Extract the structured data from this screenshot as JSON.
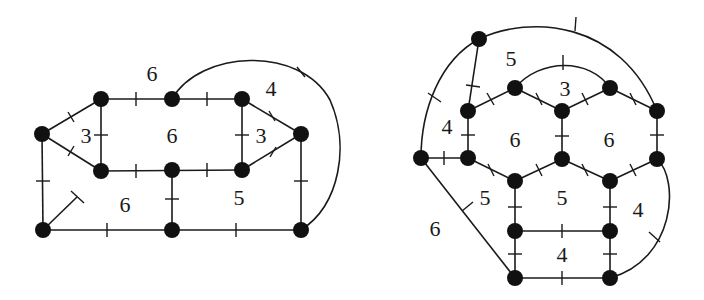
{
  "diagrams": [
    {
      "name": "left-graph",
      "nodes": [
        {
          "id": "a",
          "x": 42,
          "y": 134
        },
        {
          "id": "b",
          "x": 101,
          "y": 99
        },
        {
          "id": "c",
          "x": 101,
          "y": 171
        },
        {
          "id": "d",
          "x": 172,
          "y": 99
        },
        {
          "id": "e",
          "x": 172,
          "y": 170
        },
        {
          "id": "f",
          "x": 242,
          "y": 99
        },
        {
          "id": "g",
          "x": 242,
          "y": 170
        },
        {
          "id": "h",
          "x": 301,
          "y": 134
        },
        {
          "id": "i",
          "x": 43,
          "y": 230
        },
        {
          "id": "j",
          "x": 172,
          "y": 230
        },
        {
          "id": "k",
          "x": 301,
          "y": 230
        }
      ],
      "face_labels": [
        {
          "text": "6",
          "x": 152,
          "y": 74
        },
        {
          "text": "4",
          "x": 271,
          "y": 90
        },
        {
          "text": "3",
          "x": 86,
          "y": 137
        },
        {
          "text": "6",
          "x": 172,
          "y": 137
        },
        {
          "text": "3",
          "x": 260,
          "y": 137
        },
        {
          "text": "6",
          "x": 125,
          "y": 207
        },
        {
          "text": "5",
          "x": 239,
          "y": 200
        }
      ]
    },
    {
      "name": "right-graph",
      "nodes": [
        {
          "id": "p",
          "x": 479,
          "y": 39
        },
        {
          "id": "q",
          "x": 515,
          "y": 88
        },
        {
          "id": "r",
          "x": 610,
          "y": 88
        },
        {
          "id": "s",
          "x": 468,
          "y": 111
        },
        {
          "id": "t",
          "x": 562,
          "y": 111
        },
        {
          "id": "u",
          "x": 657,
          "y": 111
        },
        {
          "id": "v",
          "x": 421,
          "y": 158
        },
        {
          "id": "w",
          "x": 468,
          "y": 158
        },
        {
          "id": "x",
          "x": 562,
          "y": 159
        },
        {
          "id": "y",
          "x": 657,
          "y": 159
        },
        {
          "id": "z",
          "x": 515,
          "y": 181
        },
        {
          "id": "aa",
          "x": 610,
          "y": 181
        },
        {
          "id": "ab",
          "x": 515,
          "y": 231
        },
        {
          "id": "ac",
          "x": 610,
          "y": 231
        },
        {
          "id": "ad",
          "x": 515,
          "y": 278
        },
        {
          "id": "ae",
          "x": 610,
          "y": 278
        }
      ],
      "face_labels": [
        {
          "text": "5",
          "x": 511,
          "y": 61
        },
        {
          "text": "3",
          "x": 565,
          "y": 90
        },
        {
          "text": "4",
          "x": 447,
          "y": 128
        },
        {
          "text": "6",
          "x": 515,
          "y": 141
        },
        {
          "text": "6",
          "x": 609,
          "y": 141
        },
        {
          "text": "5",
          "x": 485,
          "y": 200
        },
        {
          "text": "5",
          "x": 562,
          "y": 200
        },
        {
          "text": "4",
          "x": 638,
          "y": 211
        },
        {
          "text": "6",
          "x": 435,
          "y": 230
        },
        {
          "text": "4",
          "x": 562,
          "y": 257
        }
      ]
    }
  ]
}
